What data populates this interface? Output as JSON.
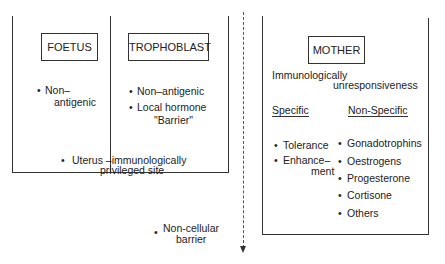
{
  "fetal_side": {
    "foetus": {
      "title": "FOETUS",
      "items": [
        "Non–",
        "antigenic"
      ]
    },
    "trophoblast": {
      "title": "TROPHOBLAST",
      "items": [
        "Non–antigenic",
        "Local hormone",
        "\"Barrier\""
      ]
    },
    "uterus": [
      "Uterus –immunologically",
      "privileged site"
    ],
    "non_cellular": [
      "Non-cellular",
      "barrier"
    ]
  },
  "maternal_side": {
    "title": "MOTHER",
    "heading": [
      "Immunologically",
      "unresponsiveness"
    ],
    "specific": {
      "label": "Specific",
      "items": [
        "Tolerance",
        "Enhance–",
        "ment"
      ]
    },
    "non_specific": {
      "label": "Non-Specific",
      "items": [
        "Gonadotrophins",
        "Oestrogens",
        "Progesterone",
        "Cortisone",
        "Others"
      ]
    }
  }
}
